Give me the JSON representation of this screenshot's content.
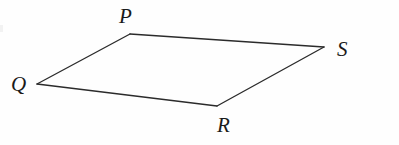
{
  "figure": {
    "name": "quadrilateral-pqrs",
    "background_color": "#fefefe",
    "stroke_color": "#2b2b2b",
    "label_color": "#1a1a1a",
    "canvas": {
      "width": 399,
      "height": 145
    },
    "vertices": [
      {
        "id": "P",
        "label": "P",
        "x": 130,
        "y": 34
      },
      {
        "id": "Q",
        "label": "Q",
        "x": 37,
        "y": 84
      },
      {
        "id": "R",
        "label": "R",
        "x": 217,
        "y": 106
      },
      {
        "id": "S",
        "label": "S",
        "x": 324,
        "y": 47
      }
    ],
    "edges": [
      {
        "id": "QP",
        "from": "Q",
        "to": "P"
      },
      {
        "id": "PS",
        "from": "P",
        "to": "S"
      },
      {
        "id": "SR",
        "from": "S",
        "to": "R"
      },
      {
        "id": "RQ",
        "from": "R",
        "to": "Q"
      }
    ],
    "labels": {
      "P": "P",
      "Q": "Q",
      "R": "R",
      "S": "S"
    }
  }
}
